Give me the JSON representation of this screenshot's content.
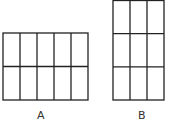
{
  "figures": [
    {
      "label": "A",
      "columns": 5,
      "rows": 2,
      "x": 3,
      "y": 33,
      "width": 85,
      "height": 67
    },
    {
      "label": "B",
      "columns": 3,
      "rows": 3,
      "x": 113,
      "y": 0.5,
      "width": 51,
      "height": 99.5
    }
  ],
  "stroke_color": "#222222"
}
